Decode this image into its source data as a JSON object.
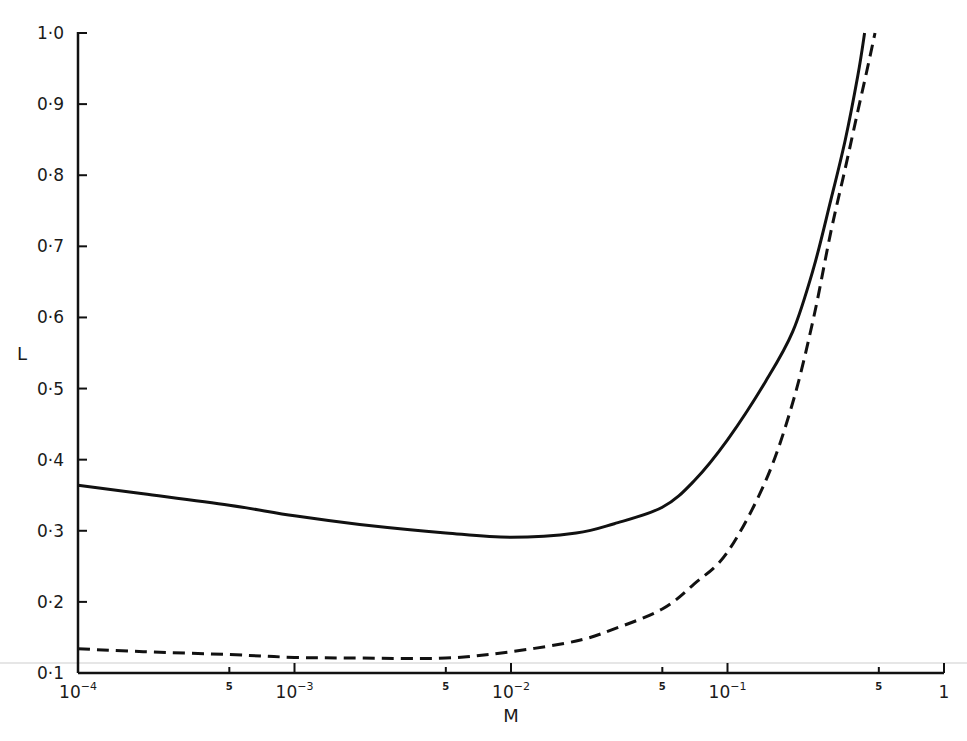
{
  "chart_data": {
    "type": "line",
    "title": "",
    "xlabel": "M",
    "ylabel": "L",
    "xscale": "log",
    "xlim": [
      0.0001,
      1
    ],
    "ylim": [
      0.1,
      1.0
    ],
    "grid": false,
    "legend": null,
    "x_ticks": [
      {
        "value": 0.0001,
        "label": "10",
        "sup": "−4",
        "major": true
      },
      {
        "value": 0.0005,
        "label": "5",
        "sup": "",
        "major": false
      },
      {
        "value": 0.001,
        "label": "10",
        "sup": "−3",
        "major": true
      },
      {
        "value": 0.005,
        "label": "5",
        "sup": "",
        "major": false
      },
      {
        "value": 0.01,
        "label": "10",
        "sup": "−2",
        "major": true
      },
      {
        "value": 0.05,
        "label": "5",
        "sup": "",
        "major": false
      },
      {
        "value": 0.1,
        "label": "10",
        "sup": "−1",
        "major": true
      },
      {
        "value": 0.5,
        "label": "5",
        "sup": "",
        "major": false
      },
      {
        "value": 1,
        "label": "1",
        "sup": "",
        "major": true
      }
    ],
    "y_ticks": [
      {
        "value": 0.1,
        "label": "0·1"
      },
      {
        "value": 0.2,
        "label": "0·2"
      },
      {
        "value": 0.3,
        "label": "0·3"
      },
      {
        "value": 0.4,
        "label": "0·4"
      },
      {
        "value": 0.5,
        "label": "0·5"
      },
      {
        "value": 0.6,
        "label": "0·6"
      },
      {
        "value": 0.7,
        "label": "0·7"
      },
      {
        "value": 0.8,
        "label": "0·8"
      },
      {
        "value": 0.9,
        "label": "0·9"
      },
      {
        "value": 1.0,
        "label": "1·0"
      }
    ],
    "series": [
      {
        "name": "solid",
        "style": "solid",
        "color": "#111111",
        "x": [
          0.0001,
          0.0002,
          0.0005,
          0.001,
          0.002,
          0.005,
          0.01,
          0.02,
          0.03,
          0.05,
          0.07,
          0.1,
          0.15,
          0.2,
          0.25,
          0.3,
          0.35,
          0.4,
          0.43
        ],
        "y": [
          0.364,
          0.352,
          0.336,
          0.321,
          0.309,
          0.297,
          0.291,
          0.297,
          0.31,
          0.333,
          0.37,
          0.428,
          0.51,
          0.58,
          0.67,
          0.765,
          0.85,
          0.94,
          1.0
        ]
      },
      {
        "name": "dashed",
        "style": "dashed",
        "color": "#111111",
        "x": [
          0.0001,
          0.0002,
          0.0005,
          0.001,
          0.002,
          0.005,
          0.01,
          0.02,
          0.03,
          0.05,
          0.07,
          0.1,
          0.15,
          0.2,
          0.25,
          0.3,
          0.35,
          0.4,
          0.45,
          0.48
        ],
        "y": [
          0.134,
          0.13,
          0.126,
          0.122,
          0.121,
          0.121,
          0.13,
          0.145,
          0.162,
          0.19,
          0.225,
          0.27,
          0.37,
          0.48,
          0.6,
          0.72,
          0.81,
          0.89,
          0.96,
          1.0
        ]
      }
    ]
  }
}
